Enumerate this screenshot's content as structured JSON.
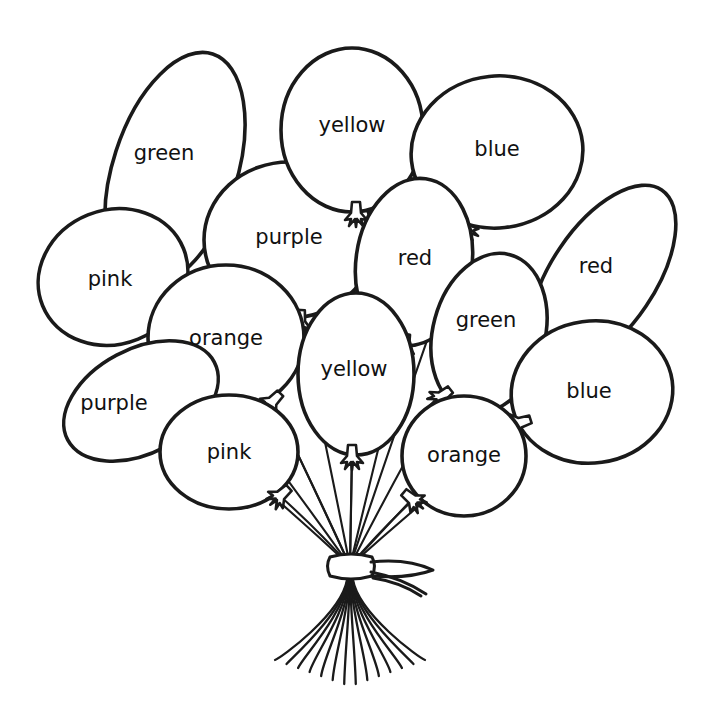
{
  "page": {
    "width": 706,
    "height": 725,
    "background_color": "#ffffff",
    "line_color": "#1a1a1a",
    "style": "black-and-white line-art coloring page"
  },
  "artwork": {
    "subject": "balloon-bouquet",
    "balloon_count": 13,
    "tie_ribbon": "bow-knot",
    "string_tail_count": 13
  },
  "balloons": [
    {
      "id": "green-tall-left",
      "label": "green",
      "shape": "ellipse",
      "cx": 175,
      "cy": 170,
      "rx": 62,
      "ry": 122,
      "rotate": 18,
      "label_x": 164,
      "label_y": 154,
      "knot_x": 216,
      "knot_y": 284,
      "knot_rotate": 22
    },
    {
      "id": "pink-upper-left",
      "label": "pink",
      "shape": "ellipse",
      "cx": 113,
      "cy": 277,
      "rx": 76,
      "ry": 67,
      "rotate": -22,
      "label_x": 110,
      "label_y": 280,
      "knot_x": 170,
      "knot_y": 323,
      "knot_rotate": 50
    },
    {
      "id": "purple-center-top",
      "label": "purple",
      "shape": "ellipse",
      "cx": 289,
      "cy": 240,
      "rx": 85,
      "ry": 78,
      "rotate": 0,
      "label_x": 289,
      "label_y": 238,
      "knot_x": 300,
      "knot_y": 322,
      "knot_rotate": 4
    },
    {
      "id": "yellow-top",
      "label": "yellow",
      "shape": "ellipse",
      "cx": 352,
      "cy": 130,
      "rx": 71,
      "ry": 82,
      "rotate": 0,
      "label_x": 352,
      "label_y": 126,
      "knot_x": 356,
      "knot_y": 214,
      "knot_rotate": 0
    },
    {
      "id": "blue-top-right",
      "label": "blue",
      "shape": "ellipse",
      "cx": 497,
      "cy": 152,
      "rx": 86,
      "ry": 76,
      "rotate": -6,
      "label_x": 497,
      "label_y": 150,
      "knot_x": 466,
      "knot_y": 229,
      "knot_rotate": -30
    },
    {
      "id": "red-center",
      "label": "red",
      "shape": "ellipse",
      "cx": 414,
      "cy": 262,
      "rx": 58,
      "ry": 84,
      "rotate": 8,
      "label_x": 415,
      "label_y": 259,
      "knot_x": 404,
      "knot_y": 346,
      "knot_rotate": 10
    },
    {
      "id": "red-right-tall",
      "label": "red",
      "shape": "ellipse",
      "cx": 603,
      "cy": 277,
      "rx": 52,
      "ry": 105,
      "rotate": 34,
      "label_x": 596,
      "label_y": 267,
      "knot_x": 552,
      "knot_y": 354,
      "knot_rotate": 40
    },
    {
      "id": "green-right",
      "label": "green",
      "shape": "ellipse",
      "cx": 489,
      "cy": 333,
      "rx": 56,
      "ry": 81,
      "rotate": 15,
      "label_x": 486,
      "label_y": 321,
      "knot_x": 441,
      "knot_y": 397,
      "knot_rotate": 52
    },
    {
      "id": "orange-left",
      "label": "orange",
      "shape": "ellipse",
      "cx": 226,
      "cy": 338,
      "rx": 78,
      "ry": 73,
      "rotate": 0,
      "label_x": 226,
      "label_y": 339,
      "knot_x": 272,
      "knot_y": 402,
      "knot_rotate": 44
    },
    {
      "id": "yellow-center-low",
      "label": "yellow",
      "shape": "ellipse",
      "cx": 356,
      "cy": 374,
      "rx": 58,
      "ry": 81,
      "rotate": 0,
      "label_x": 354,
      "label_y": 370,
      "knot_x": 352,
      "knot_y": 457,
      "knot_rotate": 0
    },
    {
      "id": "purple-lower-left",
      "label": "purple",
      "shape": "ellipse",
      "cx": 141,
      "cy": 401,
      "rx": 83,
      "ry": 52,
      "rotate": -28,
      "label_x": 114,
      "label_y": 404,
      "knot_x": 210,
      "knot_y": 443,
      "knot_rotate": 40
    },
    {
      "id": "blue-right-low",
      "label": "blue",
      "shape": "ellipse",
      "cx": 592,
      "cy": 392,
      "rx": 81,
      "ry": 71,
      "rotate": -8,
      "label_x": 589,
      "label_y": 392,
      "knot_x": 519,
      "knot_y": 423,
      "knot_rotate": 72
    },
    {
      "id": "pink-bottom",
      "label": "pink",
      "shape": "ellipse",
      "cx": 229,
      "cy": 452,
      "rx": 69,
      "ry": 57,
      "rotate": 0,
      "label_x": 229,
      "label_y": 453,
      "knot_x": 280,
      "knot_y": 496,
      "knot_rotate": 48
    },
    {
      "id": "orange-bottom-right",
      "label": "orange",
      "shape": "ellipse",
      "cx": 464,
      "cy": 456,
      "rx": 62,
      "ry": 60,
      "rotate": 0,
      "label_x": 464,
      "label_y": 456,
      "knot_x": 413,
      "knot_y": 500,
      "knot_rotate": -50
    }
  ],
  "bouquet": {
    "tie_x": 350,
    "tie_y": 566,
    "bow_label": "ribbon-bow",
    "tail_bottom_y": 686
  }
}
